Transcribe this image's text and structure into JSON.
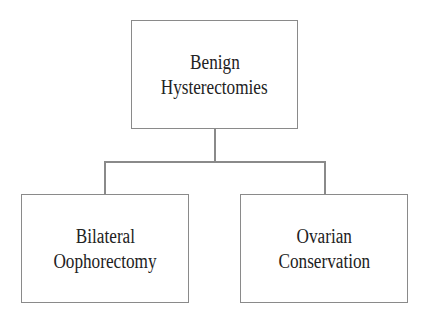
{
  "diagram": {
    "type": "tree",
    "root": {
      "lines": [
        "Benign",
        "Hysterectomies"
      ]
    },
    "children": [
      {
        "lines": [
          "Bilateral",
          "Oophorectomy"
        ]
      },
      {
        "lines": [
          "Ovarian",
          "Conservation"
        ]
      }
    ],
    "colors": {
      "border": "#8a8a8a",
      "text": "#222222",
      "background": "#ffffff"
    }
  }
}
